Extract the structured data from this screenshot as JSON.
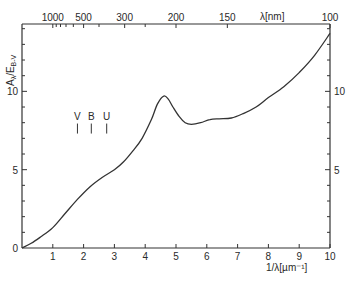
{
  "chart_data": {
    "type": "line",
    "title": "",
    "xlabel": "1/λ[µm⁻¹]",
    "ylabel": "Aλ/E_B-V",
    "ylabel_main": "A",
    "ylabel_sub1": "λ",
    "ylabel_mid": "/E",
    "ylabel_sub2": "B-V",
    "top_xlabel": "λ[nm]",
    "xlim": [
      0,
      10
    ],
    "ylim": [
      0,
      14.3
    ],
    "grid": false,
    "legend": null,
    "x_ticks": [
      1,
      2,
      3,
      4,
      5,
      6,
      7,
      8,
      9,
      10
    ],
    "x_tick_labels": [
      "1",
      "2",
      "3",
      "4",
      "5",
      "6",
      "7",
      "8",
      "9",
      "10"
    ],
    "y_ticks_labeled": [
      0,
      5,
      10
    ],
    "y_tick_labels": [
      "0",
      "5",
      "10"
    ],
    "y_minor_step": 1,
    "right_y_tick_labels": [
      "5",
      "10"
    ],
    "top_ticks_nm": [
      1000,
      500,
      300,
      200,
      150,
      100
    ],
    "top_tick_labels": [
      "1000",
      "500",
      "300",
      "200",
      "150",
      "100"
    ],
    "top_minor_ticks_nm": [
      900,
      800,
      700,
      600,
      400,
      250
    ],
    "x": [
      0.0,
      0.3,
      0.6,
      1.0,
      1.4,
      1.8,
      2.2,
      2.6,
      3.0,
      3.3,
      3.6,
      3.9,
      4.2,
      4.4,
      4.6,
      4.75,
      4.9,
      5.1,
      5.3,
      5.5,
      5.8,
      6.1,
      6.4,
      6.8,
      7.2,
      7.6,
      8.0,
      8.5,
      9.0,
      9.5,
      10.0
    ],
    "values": [
      0.0,
      0.3,
      0.7,
      1.3,
      2.2,
      3.1,
      3.9,
      4.5,
      5.0,
      5.5,
      6.2,
      7.0,
      8.2,
      9.2,
      9.7,
      9.5,
      9.0,
      8.4,
      8.0,
      7.9,
      8.0,
      8.2,
      8.25,
      8.3,
      8.6,
      9.0,
      9.6,
      10.3,
      11.2,
      12.3,
      13.7
    ],
    "series": [
      {
        "name": "Interstellar extinction curve"
      }
    ],
    "annotations": [
      {
        "label": "V",
        "x": 1.8,
        "y": 8.2
      },
      {
        "label": "B",
        "x": 2.25,
        "y": 8.2
      },
      {
        "label": "U",
        "x": 2.75,
        "y": 8.2
      }
    ]
  }
}
